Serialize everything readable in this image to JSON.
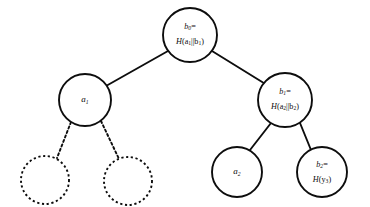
{
  "diagram": {
    "background_color": "#ffffff",
    "stroke_color": "#0d0d0d",
    "nodes": [
      {
        "id": "root",
        "name": "node-b0",
        "style": "solid",
        "cx": 190,
        "cy": 35,
        "r": 27,
        "label_line1_base": "b",
        "label_line1_sub": "0",
        "label_line1_suffix": "=",
        "label_line2_fn": "H",
        "label_line2_open": "(a",
        "label_line2_sub1": "1",
        "label_line2_sep": "||b",
        "label_line2_sub2": "1",
        "label_line2_close": ")",
        "label_text": "b0= H(a1||b1)"
      },
      {
        "id": "a1",
        "name": "node-a1",
        "style": "solid",
        "cx": 85,
        "cy": 100,
        "r": 26,
        "label_base": "a",
        "label_sub": "1",
        "label_text": "a1"
      },
      {
        "id": "b1",
        "name": "node-b1",
        "style": "solid",
        "cx": 285,
        "cy": 100,
        "r": 27,
        "label_line1_base": "b",
        "label_line1_sub": "1",
        "label_line1_suffix": "=",
        "label_line2_fn": "H",
        "label_line2_open": "(a",
        "label_line2_sub1": "2",
        "label_line2_sep": "||b",
        "label_line2_sub2": "2",
        "label_line2_close": ")",
        "label_text": "b1= H(a2||b2)"
      },
      {
        "id": "a2",
        "name": "node-a2",
        "style": "solid",
        "cx": 237,
        "cy": 172,
        "r": 25,
        "label_base": "a",
        "label_sub": "2",
        "label_text": "a2"
      },
      {
        "id": "b2",
        "name": "node-b2",
        "style": "solid",
        "cx": 322,
        "cy": 172,
        "r": 25,
        "label_line1_base": "b",
        "label_line1_sub": "2",
        "label_line1_suffix": "=",
        "label_line2_fn": "H",
        "label_line2_open": "(y",
        "label_line2_sub1": "3",
        "label_line2_close": ")",
        "label_text": "b2= H(y3)"
      },
      {
        "id": "ghost-left",
        "name": "node-placeholder-left",
        "style": "dashed",
        "cx": 45,
        "cy": 180,
        "r": 24,
        "label_text": ""
      },
      {
        "id": "ghost-right",
        "name": "node-placeholder-right",
        "style": "dashed",
        "cx": 128,
        "cy": 181,
        "r": 24,
        "label_text": ""
      }
    ],
    "edges": [
      {
        "name": "edge-root-to-a1",
        "style": "solid",
        "x1": 168,
        "y1": 51,
        "x2": 106,
        "y2": 86
      },
      {
        "name": "edge-root-to-b1",
        "style": "solid",
        "x1": 212,
        "y1": 51,
        "x2": 267,
        "y2": 85
      },
      {
        "name": "edge-b1-to-a2",
        "style": "solid",
        "x1": 271,
        "y1": 123,
        "x2": 250,
        "y2": 150
      },
      {
        "name": "edge-b1-to-b2",
        "style": "solid",
        "x1": 300,
        "y1": 123,
        "x2": 311,
        "y2": 150
      },
      {
        "name": "edge-a1-to-placeholder-left",
        "style": "dashed",
        "x1": 71,
        "y1": 122,
        "x2": 57,
        "y2": 158
      },
      {
        "name": "edge-a1-to-placeholder-right",
        "style": "dashed",
        "x1": 101,
        "y1": 121,
        "x2": 119,
        "y2": 159
      }
    ]
  }
}
